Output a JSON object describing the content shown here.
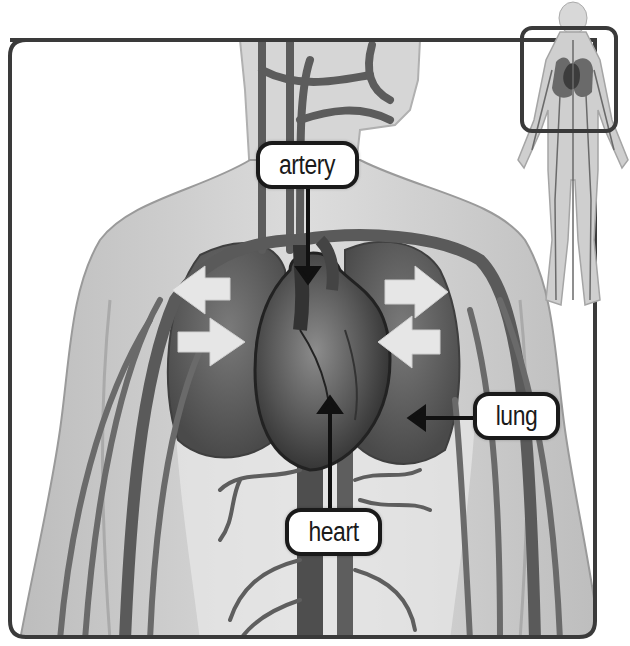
{
  "diagram": {
    "labels": [
      {
        "id": "artery",
        "text": "artery",
        "points_to": "aortic arch"
      },
      {
        "id": "lung",
        "text": "lung",
        "points_to": "left lung"
      },
      {
        "id": "heart",
        "text": "heart",
        "points_to": "heart"
      }
    ],
    "inset": {
      "description": "full-body circulatory system figure with highlighted chest region box"
    },
    "flow_arrows": {
      "count": 4,
      "meaning": "air/blood exchange direction at lungs",
      "color": "#e6e6e6"
    }
  },
  "colors": {
    "frame": "#3a3a3a",
    "body_fill": "#c8c8c8",
    "vessel": "#6a6a6a",
    "lung": "#5a5a5a",
    "heart": "#4a4a4a",
    "label_border": "#1a1a1a",
    "label_bg": "#ffffff"
  }
}
